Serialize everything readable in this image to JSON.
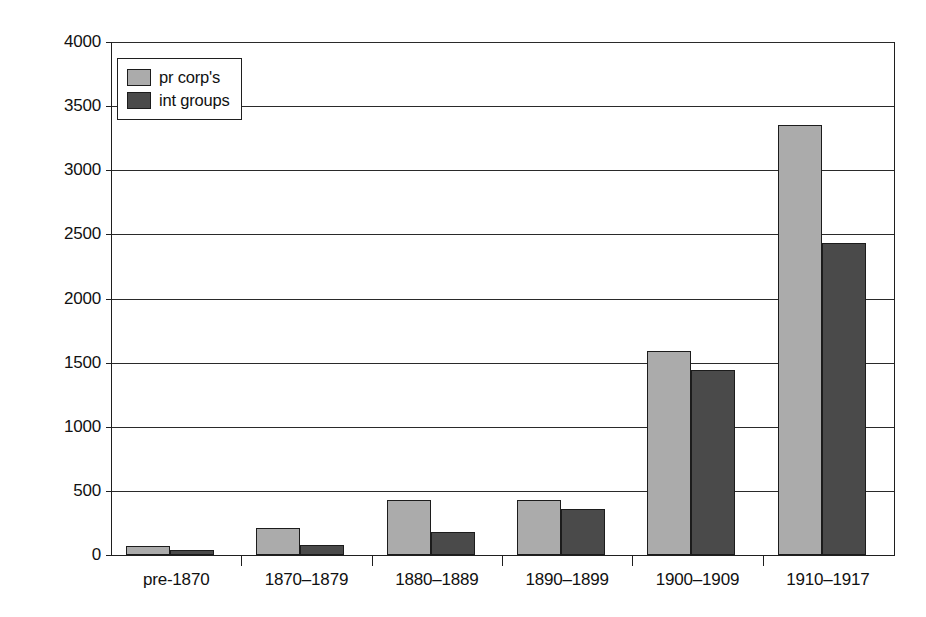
{
  "chart_data": {
    "type": "bar",
    "title": "",
    "subtitle": "",
    "xlabel": "",
    "ylabel": "",
    "categories": [
      "pre-1870",
      "1870–1879",
      "1880–1889",
      "1890–1899",
      "1900–1909",
      "1910–1917"
    ],
    "series": [
      {
        "name": "pr corp's",
        "values": [
          70,
          210,
          430,
          430,
          1590,
          3350
        ],
        "color": "#ababab"
      },
      {
        "name": "int groups",
        "values": [
          40,
          80,
          180,
          360,
          1440,
          2430
        ],
        "color": "#4a4a4a"
      }
    ],
    "ylim": [
      0,
      4000
    ],
    "ytick_labels": [
      "0",
      "500",
      "1000",
      "1500",
      "2000",
      "2500",
      "3000",
      "3500",
      "4000"
    ],
    "ytick_values": [
      0,
      500,
      1000,
      1500,
      2000,
      2500,
      3000,
      3500,
      4000
    ],
    "grid": true,
    "grid_axis": "y",
    "legend_position": "top-left-inside",
    "bar_border_color": "#1c1c1c",
    "axis_color": "#1f1f1f",
    "background_color": "#ffffff"
  },
  "legend": {
    "entries": [
      {
        "label": "pr corp's"
      },
      {
        "label": "int groups"
      }
    ]
  }
}
